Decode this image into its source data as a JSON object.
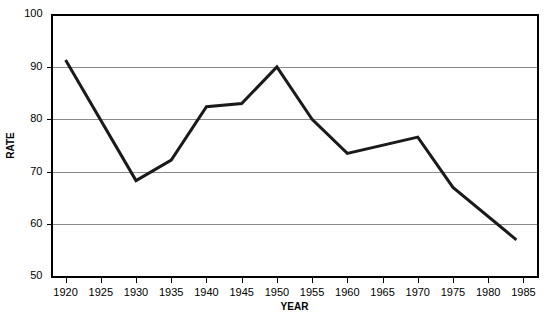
{
  "chart_data": {
    "type": "line",
    "title": "",
    "xlabel": "YEAR",
    "ylabel": "RATE",
    "xlim": [
      1918,
      1987
    ],
    "ylim": [
      50,
      100
    ],
    "grid": true,
    "legend": null,
    "line_color": "#1a1a1a",
    "grid_color": "#8a8a8a",
    "axis_color": "#000000",
    "y_ticks": [
      {
        "value": 100,
        "label": "100"
      },
      {
        "value": 90,
        "label": "90"
      },
      {
        "value": 80,
        "label": "80"
      },
      {
        "value": 70,
        "label": "70"
      },
      {
        "value": 60,
        "label": "60"
      },
      {
        "value": 50,
        "label": "50"
      }
    ],
    "y_gridlines": [
      90,
      80,
      70,
      60
    ],
    "x_ticks": [
      {
        "value": 1920,
        "label": "1920"
      },
      {
        "value": 1925,
        "label": "1925"
      },
      {
        "value": 1930,
        "label": "1930"
      },
      {
        "value": 1935,
        "label": "1935"
      },
      {
        "value": 1940,
        "label": "1940"
      },
      {
        "value": 1945,
        "label": "1945"
      },
      {
        "value": 1950,
        "label": "1950"
      },
      {
        "value": 1955,
        "label": "1955"
      },
      {
        "value": 1960,
        "label": "1960"
      },
      {
        "value": 1965,
        "label": "1965"
      },
      {
        "value": 1970,
        "label": "1970"
      },
      {
        "value": 1975,
        "label": "1975"
      },
      {
        "value": 1980,
        "label": "1980"
      },
      {
        "value": 1985,
        "label": "1985"
      }
    ],
    "series": [
      {
        "name": "rate",
        "x": [
          1920,
          1930,
          1935,
          1940,
          1945,
          1950,
          1955,
          1960,
          1970,
          1975,
          1984
        ],
        "values": [
          91.3,
          68.3,
          72.2,
          82.4,
          83.0,
          90.0,
          80.0,
          73.5,
          76.6,
          67.0,
          57.0
        ]
      }
    ]
  }
}
